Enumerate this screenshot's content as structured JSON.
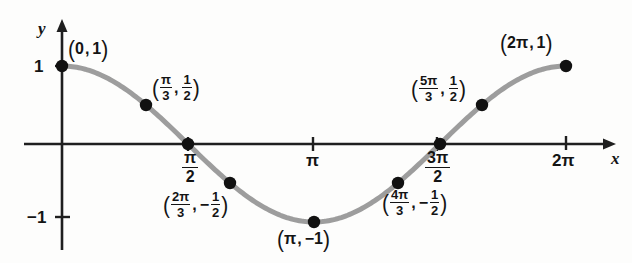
{
  "figure": {
    "kind": "cosine-curve-graph",
    "curve_color": "#9d9d9d",
    "axis_color": "#1f1f1f",
    "point_color": "#111111",
    "background": "#fdfdfc"
  },
  "axes": {
    "x_label": "x",
    "y_label": "y",
    "x_ticks": [
      {
        "id": "pi-over-2",
        "numerator": "π",
        "denominator": "2",
        "value": 1.5707963
      },
      {
        "id": "pi",
        "text": "π",
        "value": 3.1415927
      },
      {
        "id": "three-pi-over-2",
        "numerator": "3π",
        "denominator": "2",
        "value": 4.712389
      },
      {
        "id": "two-pi",
        "text": "2π",
        "value": 6.2831853
      }
    ],
    "y_ticks": [
      {
        "id": "one",
        "text": "1",
        "value": 1
      },
      {
        "id": "minus-one",
        "text": "−1",
        "value": -1
      }
    ]
  },
  "chart_data": {
    "type": "line",
    "title": "",
    "xlabel": "x",
    "ylabel": "y",
    "grid": false,
    "legend": null,
    "function": "y = cos(x)",
    "xlim": [
      0,
      6.2831853
    ],
    "ylim": [
      -1,
      1
    ],
    "x_tick_values": [
      1.5707963,
      3.1415927,
      4.712389,
      6.2831853
    ],
    "x_tick_labels": [
      "π/2",
      "π",
      "3π/2",
      "2π"
    ],
    "y_tick_values": [
      1,
      -1
    ],
    "y_tick_labels": [
      "1",
      "−1"
    ],
    "points": [
      {
        "id": "p0",
        "x": 0,
        "y": 1,
        "x_text": "0",
        "y_text": "1",
        "labeled": true
      },
      {
        "id": "p1",
        "x": 1.0471976,
        "y": 0.5,
        "x_text": "π/3",
        "y_text": "1/2",
        "labeled": true
      },
      {
        "id": "p2",
        "x": 1.5707963,
        "y": 0,
        "x_text": "π/2",
        "y_text": "0",
        "labeled": false
      },
      {
        "id": "p3",
        "x": 2.0943951,
        "y": -0.5,
        "x_text": "2π/3",
        "y_text": "−1/2",
        "labeled": true
      },
      {
        "id": "p4",
        "x": 3.1415927,
        "y": -1,
        "x_text": "π",
        "y_text": "−1",
        "labeled": true
      },
      {
        "id": "p5",
        "x": 4.1887902,
        "y": -0.5,
        "x_text": "4π/3",
        "y_text": "−1/2",
        "labeled": true
      },
      {
        "id": "p6",
        "x": 4.712389,
        "y": 0,
        "x_text": "3π/2",
        "y_text": "0",
        "labeled": false
      },
      {
        "id": "p7",
        "x": 5.2359878,
        "y": 0.5,
        "x_text": "5π/3",
        "y_text": "1/2",
        "labeled": true
      },
      {
        "id": "p8",
        "x": 6.2831853,
        "y": 1,
        "x_text": "2π",
        "y_text": "1",
        "labeled": true
      }
    ]
  },
  "annotations": {
    "origin_point": {
      "open": "(",
      "x": "0",
      "comma": ",",
      "y": "1",
      "close": ")"
    },
    "pi3_point": {
      "open": "(",
      "x_num": "π",
      "x_den": "3",
      "comma": ",",
      "y_num": "1",
      "y_den": "2",
      "close": ")"
    },
    "twopi3_point": {
      "open": "(",
      "x_num": "2π",
      "x_den": "3",
      "comma": ",",
      "minus": "−",
      "y_num": "1",
      "y_den": "2",
      "close": ")"
    },
    "pi_point": {
      "open": "(",
      "x": "π",
      "comma": ",",
      "y": "−1",
      "close": ")"
    },
    "fourpi3_point": {
      "open": "(",
      "x_num": "4π",
      "x_den": "3",
      "comma": ",",
      "minus": "−",
      "y_num": "1",
      "y_den": "2",
      "close": ")"
    },
    "fivepi3_point": {
      "open": "(",
      "x_num": "5π",
      "x_den": "3",
      "comma": ",",
      "y_num": "1",
      "y_den": "2",
      "close": ")"
    },
    "twopi_point": {
      "open": "(",
      "x": "2π",
      "comma": ",",
      "y": "1",
      "close": ")"
    }
  },
  "tick_labels": {
    "pi_over_2": {
      "num": "π",
      "den": "2"
    },
    "pi": "π",
    "three_pi_over_2": {
      "num": "3π",
      "den": "2"
    },
    "two_pi": "2π",
    "y_one": "1",
    "y_minus_one": "−1"
  }
}
